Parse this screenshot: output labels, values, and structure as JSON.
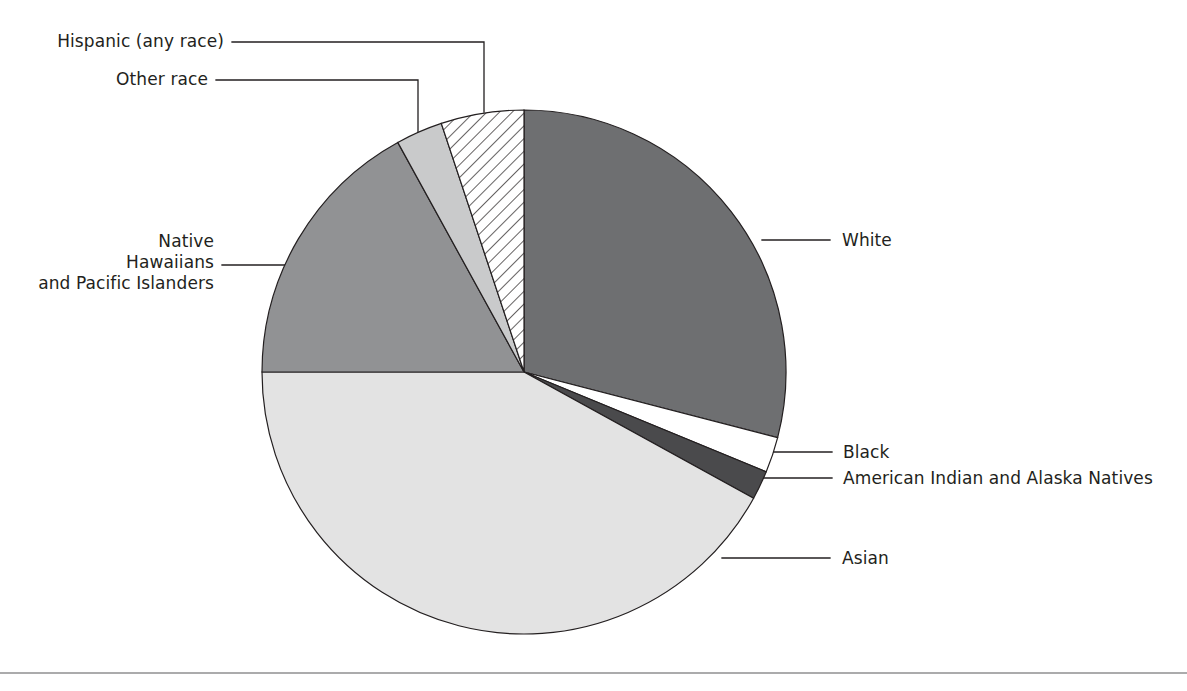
{
  "figure": {
    "background_color": "#ffffff",
    "rule_color": "#58595b",
    "outline_color": "#231f20",
    "leader_color": "#231f20"
  },
  "chart_data": {
    "type": "pie",
    "title": "",
    "subtitle": "",
    "xlabel": "",
    "ylabel": "",
    "legend_position": "callout-labels",
    "grid": false,
    "units": "percent of population",
    "start_angle_deg": 0,
    "direction": "clockwise",
    "categories": [
      "White",
      "Black",
      "American Indian and Alaska Natives",
      "Asian",
      "Native Hawaiians and Pacific Islanders",
      "Other race",
      "Hispanic (any race)"
    ],
    "values": [
      29.0,
      2.2,
      1.8,
      42.0,
      17.0,
      2.9,
      5.1
    ],
    "slices": [
      {
        "label": "White",
        "value": 29.0,
        "start_deg": 0.0,
        "end_deg": 104.5,
        "fill": "#6e6f71",
        "pattern": "solid"
      },
      {
        "label": "Black",
        "value": 2.2,
        "start_deg": 104.5,
        "end_deg": 112.4,
        "fill": "#ffffff",
        "pattern": "solid"
      },
      {
        "label": "American Indian and Alaska Natives",
        "value": 1.8,
        "start_deg": 112.4,
        "end_deg": 118.8,
        "fill": "#4a4a4c",
        "pattern": "solid"
      },
      {
        "label": "Asian",
        "value": 42.0,
        "start_deg": 118.8,
        "end_deg": 270.0,
        "fill": "#e3e3e3",
        "pattern": "solid"
      },
      {
        "label": "Native Hawaiians and Pacific Islanders",
        "value": 17.0,
        "start_deg": 270.0,
        "end_deg": 331.2,
        "fill": "#919294",
        "pattern": "solid"
      },
      {
        "label": "Other race",
        "value": 2.9,
        "start_deg": 331.2,
        "end_deg": 341.6,
        "fill": "#c9cacb",
        "pattern": "solid"
      },
      {
        "label": "Hispanic (any race)",
        "value": 5.1,
        "start_deg": 341.6,
        "end_deg": 360.0,
        "fill": "#ffffff",
        "pattern": "diagonal-hatch"
      }
    ]
  },
  "labels": {
    "hispanic": "Hispanic (any race)",
    "other_race": "Other race",
    "native_hawaiians_line1": "Native",
    "native_hawaiians_line2": "Hawaiians",
    "native_hawaiians_line3": "and Pacific Islanders",
    "white": "White",
    "black": "Black",
    "american_indian": "American Indian and Alaska Natives",
    "asian": "Asian"
  }
}
